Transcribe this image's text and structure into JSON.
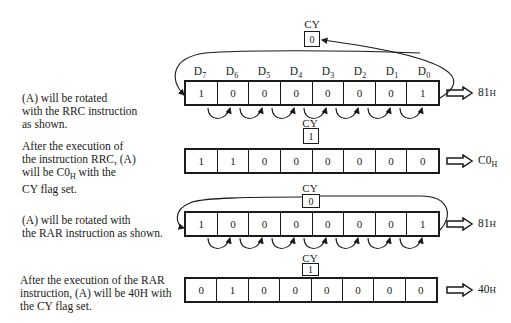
{
  "steps": [
    {
      "description": "(A) will be rotated with the RRC instruction as shown.",
      "cy_label": "CY",
      "cy_value": "0",
      "bits": [
        "1",
        "0",
        "0",
        "0",
        "0",
        "0",
        "0",
        "1"
      ],
      "result": "81H",
      "show_bit_labels": true
    },
    {
      "description": "After the execution of the instruction RRC, (A) will be C0H with the CY flag set.",
      "cy_label": "CY",
      "cy_value": "1",
      "bits": [
        "1",
        "1",
        "0",
        "0",
        "0",
        "0",
        "0",
        "0"
      ],
      "result": "C0H"
    },
    {
      "description": "(A) will be rotated with the RAR instruction as shown.",
      "cy_label": "CY",
      "cy_value": "0",
      "bits": [
        "1",
        "0",
        "0",
        "0",
        "0",
        "0",
        "0",
        "1"
      ],
      "result": "81H"
    },
    {
      "description": "After the execution of the RAR instruction, (A) will be 40H with the CY flag set.",
      "cy_label": "CY",
      "cy_value": "1",
      "bits": [
        "0",
        "1",
        "0",
        "0",
        "0",
        "0",
        "0",
        "0"
      ],
      "result": "40H"
    }
  ],
  "bit_labels": [
    "D7",
    "D6",
    "D5",
    "D4",
    "D3",
    "D2",
    "D1",
    "D0"
  ],
  "bit_label_parts": [
    {
      "base": "D",
      "sub": "7"
    },
    {
      "base": "D",
      "sub": "6"
    },
    {
      "base": "D",
      "sub": "5"
    },
    {
      "base": "D",
      "sub": "4"
    },
    {
      "base": "D",
      "sub": "3"
    },
    {
      "base": "D",
      "sub": "2"
    },
    {
      "base": "D",
      "sub": "1"
    },
    {
      "base": "D",
      "sub": "0"
    }
  ],
  "text": {
    "step1_desc_l1": "(A) will be rotated",
    "step1_desc_l2": "with the RRC instruction",
    "step1_desc_l3": "as shown.",
    "step2_desc_l1": "After the execution of",
    "step2_desc_l2": "the instruction RRC, (A)",
    "step2_desc_l3a": "will be C0",
    "step2_desc_l3sub": "H",
    "step2_desc_l3b": " with the",
    "step2_desc_l4": "CY flag set.",
    "step3_desc_l1": "(A) will be rotated with",
    "step3_desc_l2": "the RAR instruction as shown.",
    "step4_desc_l1": "After the execution of the RAR",
    "step4_desc_l2": "instruction, (A) will be 40H with",
    "step4_desc_l3": "the CY flag set.",
    "result1_main": "81",
    "result1_suffix": "H",
    "result2_main": "C0",
    "result2_suffix": "H",
    "result3_main": "81",
    "result3_suffix": "H",
    "result4_main": "40",
    "result4_suffix": "H"
  },
  "colors": {
    "ink": "#1a1a1a",
    "background": "#ffffff"
  }
}
